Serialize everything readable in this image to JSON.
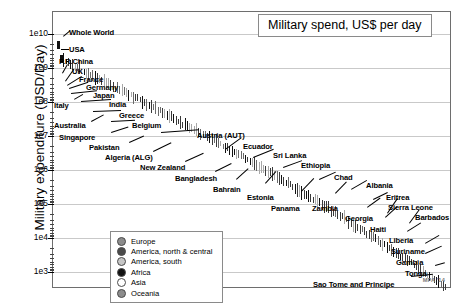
{
  "title": "Military spend, US$ per day",
  "watermark": "MPA '14",
  "axes": {
    "ylabel": "Military expenditure (USD/Day)",
    "yticks": [
      "1e10",
      "1e9",
      "1e8",
      "1e7",
      "1e6",
      "1e5",
      "1e4",
      "1e3"
    ]
  },
  "legend": {
    "items": [
      {
        "label": "Europe",
        "swatch": "#8c8c8c"
      },
      {
        "label": "America, north & central",
        "swatch": "#4a4a4a"
      },
      {
        "label": "America, south",
        "swatch": "#c6c6c6"
      },
      {
        "label": "Africa",
        "swatch": "#121212"
      },
      {
        "label": "Asia",
        "swatch": "#ffffff"
      },
      {
        "label": "Oceania",
        "swatch": "#8c8c8c"
      }
    ]
  },
  "chart_data": {
    "type": "scatter",
    "title": "Military spend, US$ per day",
    "xlabel": "",
    "ylabel": "Military expenditure (USD/Day)",
    "yscale": "log",
    "ylim": [
      1000,
      10000000000
    ],
    "grid": true,
    "legend_position": "bottom-left",
    "note": "Each country is drawn as a thin vertical tick mark; countries are ranked left-to-right in descending order of daily military expenditure.",
    "labeled_points": [
      {
        "name": "Whole World",
        "value": 4800000000
      },
      {
        "name": "USA",
        "value": 1800000000
      },
      {
        "name": "P.R.China",
        "value": 500000000
      },
      {
        "name": "UK",
        "value": 170000000
      },
      {
        "name": "France",
        "value": 165000000
      },
      {
        "name": "Germany",
        "value": 130000000
      },
      {
        "name": "Japan",
        "value": 130000000
      },
      {
        "name": "Italy",
        "value": 90000000
      },
      {
        "name": "India",
        "value": 125000000
      },
      {
        "name": "Greece",
        "value": 20000000
      },
      {
        "name": "Australia",
        "value": 70000000
      },
      {
        "name": "Belgium",
        "value": 14000000
      },
      {
        "name": "Singapore",
        "value": 25000000
      },
      {
        "name": "Austria (AUT)",
        "value": 9000000
      },
      {
        "name": "Pakistan",
        "value": 15000000
      },
      {
        "name": "Ecuador",
        "value": 6000000
      },
      {
        "name": "Algeria (ALG)",
        "value": 28000000
      },
      {
        "name": "Sri Lanka",
        "value": 4500000
      },
      {
        "name": "New Zealand",
        "value": 5500000
      },
      {
        "name": "Ethiopia",
        "value": 1100000
      },
      {
        "name": "Bangladesh",
        "value": 3600000
      },
      {
        "name": "Bahrain",
        "value": 2600000
      },
      {
        "name": "Chad",
        "value": 900000
      },
      {
        "name": "Estonia",
        "value": 1200000
      },
      {
        "name": "Albania",
        "value": 500000
      },
      {
        "name": "Panama",
        "value": 700000
      },
      {
        "name": "Zambia",
        "value": 400000
      },
      {
        "name": "Eritrea",
        "value": 230000
      },
      {
        "name": "Georgia",
        "value": 300000
      },
      {
        "name": "Sierra Leone",
        "value": 90000
      },
      {
        "name": "Haiti",
        "value": 110000
      },
      {
        "name": "Barbados",
        "value": 70000
      },
      {
        "name": "Liberia",
        "value": 45000
      },
      {
        "name": "Suriname",
        "value": 30000
      },
      {
        "name": "Gambia",
        "value": 22000
      },
      {
        "name": "Tonga",
        "value": 11000
      },
      {
        "name": "Sao Tome and Principe",
        "value": 3000
      }
    ]
  },
  "annotations": [
    {
      "text": "Whole World",
      "x": 68,
      "y": 27,
      "lx": 62,
      "ly": 35,
      "len": 9,
      "ang": -40
    },
    {
      "text": "USA",
      "x": 68,
      "y": 44,
      "lx": 60,
      "ly": 48,
      "len": 8,
      "ang": 0
    },
    {
      "text": "P.R.China",
      "x": 58,
      "y": 56,
      "lx": 61,
      "ly": 72,
      "len": 10,
      "ang": -60
    },
    {
      "text": "UK",
      "x": 71,
      "y": 66,
      "lx": 64,
      "ly": 80,
      "len": 15,
      "ang": -55
    },
    {
      "text": "France",
      "x": 78,
      "y": 74,
      "lx": 66,
      "ly": 84,
      "len": 17,
      "ang": -32
    },
    {
      "text": "Germany",
      "x": 85,
      "y": 82,
      "lx": 68,
      "ly": 87,
      "len": 20,
      "ang": -18
    },
    {
      "text": "Japan",
      "x": 92,
      "y": 90,
      "lx": 70,
      "ly": 92,
      "len": 26,
      "ang": -6
    },
    {
      "text": "Italy",
      "x": 53,
      "y": 100,
      "lx": 73,
      "ly": 98,
      "len": 10,
      "ang": -30
    },
    {
      "text": "India",
      "x": 108,
      "y": 99,
      "lx": 80,
      "ly": 100,
      "len": 30,
      "ang": -4
    },
    {
      "text": "Greece",
      "x": 118,
      "y": 110,
      "lx": 92,
      "ly": 110,
      "len": 28,
      "ang": -2
    },
    {
      "text": "Australia",
      "x": 53,
      "y": 120,
      "lx": 90,
      "ly": 120,
      "len": 14,
      "ang": -28
    },
    {
      "text": "Belgium",
      "x": 131,
      "y": 120,
      "lx": 110,
      "ly": 120,
      "len": 24,
      "ang": -3
    },
    {
      "text": "Singapore",
      "x": 58,
      "y": 132,
      "lx": 110,
      "ly": 131,
      "len": 18,
      "ang": -18
    },
    {
      "text": "Austria (AUT)",
      "x": 196,
      "y": 130,
      "lx": 160,
      "ly": 131,
      "len": 38,
      "ang": -4
    },
    {
      "text": "Pakistan",
      "x": 88,
      "y": 142,
      "lx": 128,
      "ly": 141,
      "len": 16,
      "ang": -24
    },
    {
      "text": "Ecuador",
      "x": 242,
      "y": 141,
      "lx": 224,
      "ly": 148,
      "len": 20,
      "ang": -36
    },
    {
      "text": "Algeria (ALG)",
      "x": 104,
      "y": 152,
      "lx": 152,
      "ly": 150,
      "len": 20,
      "ang": -26
    },
    {
      "text": "Sri Lanka",
      "x": 272,
      "y": 150,
      "lx": 252,
      "ly": 156,
      "len": 22,
      "ang": -22
    },
    {
      "text": "New Zealand",
      "x": 139,
      "y": 162,
      "lx": 184,
      "ly": 160,
      "len": 20,
      "ang": -24
    },
    {
      "text": "Ethiopia",
      "x": 300,
      "y": 160,
      "lx": 282,
      "ly": 166,
      "len": 20,
      "ang": -20
    },
    {
      "text": "Bangladesh",
      "x": 174,
      "y": 173,
      "lx": 214,
      "ly": 170,
      "len": 18,
      "ang": -26
    },
    {
      "text": "Bahrain",
      "x": 212,
      "y": 184,
      "lx": 235,
      "ly": 178,
      "len": 16,
      "ang": -42
    },
    {
      "text": "Chad",
      "x": 333,
      "y": 172,
      "lx": 318,
      "ly": 178,
      "len": 18,
      "ang": -24
    },
    {
      "text": "Estonia",
      "x": 246,
      "y": 192,
      "lx": 264,
      "ly": 182,
      "len": 16,
      "ang": -48
    },
    {
      "text": "Albania",
      "x": 365,
      "y": 180,
      "lx": 350,
      "ly": 188,
      "len": 18,
      "ang": -30
    },
    {
      "text": "Panama",
      "x": 270,
      "y": 203,
      "lx": 300,
      "ly": 190,
      "len": 18,
      "ang": -46
    },
    {
      "text": "Eritrea",
      "x": 385,
      "y": 192,
      "lx": 372,
      "ly": 198,
      "len": 16,
      "ang": -26
    },
    {
      "text": "Zambia",
      "x": 311,
      "y": 203,
      "lx": 334,
      "ly": 192,
      "len": 16,
      "ang": -46
    },
    {
      "text": "Sierra Leone",
      "x": 387,
      "y": 202,
      "lx": 386,
      "ly": 212,
      "len": 18,
      "ang": -56
    },
    {
      "text": "Georgia",
      "x": 344,
      "y": 213,
      "lx": 366,
      "ly": 206,
      "len": 16,
      "ang": -36
    },
    {
      "text": "Barbados",
      "x": 414,
      "y": 212,
      "lx": 408,
      "ly": 222,
      "len": 17,
      "ang": -54
    },
    {
      "text": "Haiti",
      "x": 369,
      "y": 224,
      "lx": 384,
      "ly": 216,
      "len": 16,
      "ang": -42
    },
    {
      "text": "Liberia",
      "x": 388,
      "y": 235,
      "lx": 406,
      "ly": 230,
      "len": 16,
      "ang": -32
    },
    {
      "text": "Suriname",
      "x": 390,
      "y": 246,
      "lx": 424,
      "ly": 242,
      "len": 16,
      "ang": -30
    },
    {
      "text": "Gambia",
      "x": 395,
      "y": 257,
      "lx": 424,
      "ly": 252,
      "len": 18,
      "ang": -24
    },
    {
      "text": "Tonga",
      "x": 404,
      "y": 268,
      "lx": 434,
      "ly": 264,
      "len": 10,
      "ang": -16
    },
    {
      "text": "Sao Tome and Principe",
      "x": 312,
      "y": 279,
      "lx": 410,
      "ly": 275,
      "len": 22,
      "ang": -6
    }
  ]
}
